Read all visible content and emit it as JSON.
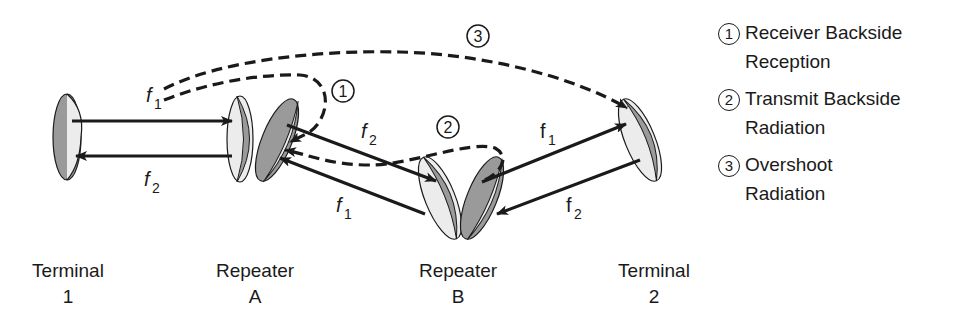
{
  "diagram": {
    "type": "microwave-relay-interference",
    "stations": [
      {
        "id": "terminal-1",
        "line1": "Terminal",
        "line2": "1"
      },
      {
        "id": "repeater-a",
        "line1": "Repeater",
        "line2": "A"
      },
      {
        "id": "repeater-b",
        "line1": "Repeater",
        "line2": "B"
      },
      {
        "id": "terminal-2",
        "line1": "Terminal",
        "line2": "2"
      }
    ],
    "link_labels": {
      "t1_ra_top": "f",
      "t1_ra_top_sub": "1",
      "t1_ra_bottom": "f",
      "t1_ra_bottom_sub": "2",
      "ra_rb_top": "f",
      "ra_rb_top_sub": "2",
      "ra_rb_bottom": "f",
      "ra_rb_bottom_sub": "1",
      "rb_t2_top": "f",
      "rb_t2_top_sub": "1",
      "rb_t2_bottom": "f",
      "rb_t2_bottom_sub": "2"
    },
    "path_markers": [
      "1",
      "2",
      "3"
    ],
    "legend": [
      {
        "num": "1",
        "line1": "Receiver Backside",
        "line2": "Reception"
      },
      {
        "num": "2",
        "line1": "Transmit Backside",
        "line2": "Radiation"
      },
      {
        "num": "3",
        "line1": "Overshoot",
        "line2": "Radiation"
      }
    ],
    "colors": {
      "line": "#1a1a1a",
      "dish_dark": "#9a9a9a",
      "dish_light": "#ececec",
      "background": "#ffffff"
    }
  }
}
